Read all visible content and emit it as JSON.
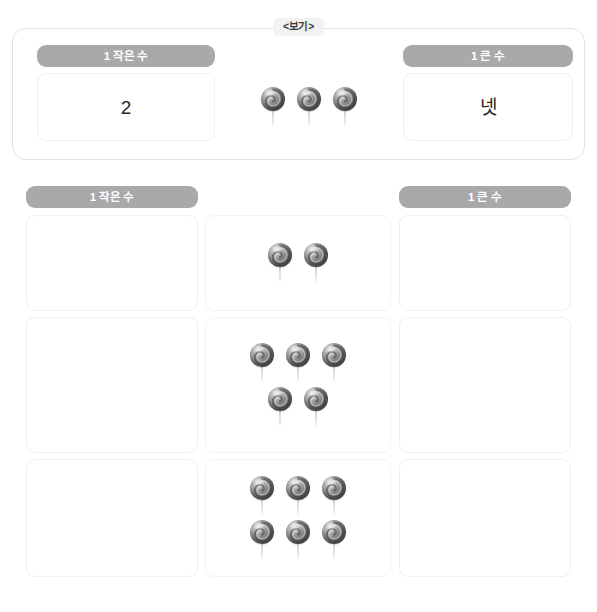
{
  "example": {
    "tab_label": "<보기>",
    "header_left": "1 작은 수",
    "header_right": "1 큰 수",
    "value_left": "2",
    "value_right": "넷",
    "candy_count": 3,
    "candy_layout": [
      3
    ]
  },
  "questions": {
    "header_left": "1 작은 수",
    "header_right": "1 큰 수",
    "rows": [
      {
        "candy_count": 2,
        "candy_layout": [
          2
        ],
        "answer_left": "",
        "answer_right": ""
      },
      {
        "candy_count": 5,
        "candy_layout": [
          3,
          2
        ],
        "answer_left": "",
        "answer_right": ""
      },
      {
        "candy_count": 6,
        "candy_layout": [
          3,
          3
        ],
        "answer_left": "",
        "answer_right": ""
      }
    ]
  },
  "colors": {
    "pill_gray": "#a9a9a9",
    "pill_text": "#ffffff",
    "cell_border": "#f0f0f0",
    "example_border": "#e2e2e2",
    "tab_background": "#f2f2f2",
    "page_background": "#ffffff",
    "candy": "#7a7a7a"
  },
  "icons": {
    "candy": "lollipop-icon"
  }
}
